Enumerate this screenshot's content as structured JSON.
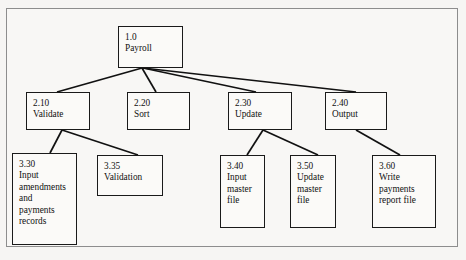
{
  "diagram": {
    "type": "hierarchy-tree",
    "background_color": "#f6f5f3",
    "frame_color": "#8d8d8d",
    "box_border_color": "#1a1a1a",
    "edge_color": "#111111",
    "levels": 3,
    "nodes": [
      {
        "id": "n1",
        "ref": "1.0",
        "lines": [
          "1.0",
          "Payroll"
        ],
        "level": 1,
        "x": 118,
        "y": 26,
        "w": 65,
        "h": 42
      },
      {
        "id": "n210",
        "ref": "2.10",
        "lines": [
          "2.10",
          "Validate"
        ],
        "level": 2,
        "x": 26,
        "y": 92,
        "w": 64,
        "h": 38
      },
      {
        "id": "n220",
        "ref": "2.20",
        "lines": [
          "2.20",
          "Sort"
        ],
        "level": 2,
        "x": 127,
        "y": 92,
        "w": 63,
        "h": 38
      },
      {
        "id": "n230",
        "ref": "2.30",
        "lines": [
          "2.30",
          "Update"
        ],
        "level": 2,
        "x": 228,
        "y": 92,
        "w": 64,
        "h": 38
      },
      {
        "id": "n240",
        "ref": "2.40",
        "lines": [
          "2.40",
          "Output"
        ],
        "level": 2,
        "x": 325,
        "y": 92,
        "w": 62,
        "h": 38
      },
      {
        "id": "n330",
        "ref": "3.30",
        "lines": [
          "3.30",
          "Input",
          "amendments",
          "and",
          "payments",
          "records"
        ],
        "level": 3,
        "x": 12,
        "y": 153,
        "w": 65,
        "h": 92
      },
      {
        "id": "n335",
        "ref": "3.35",
        "lines": [
          "3.35",
          "Validation"
        ],
        "level": 3,
        "x": 97,
        "y": 155,
        "w": 66,
        "h": 41
      },
      {
        "id": "n340",
        "ref": "3.40",
        "lines": [
          "3.40",
          "Input",
          "master",
          "file"
        ],
        "level": 3,
        "x": 220,
        "y": 155,
        "w": 45,
        "h": 73
      },
      {
        "id": "n350",
        "ref": "3.50",
        "lines": [
          "3.50",
          "Update",
          "master",
          "file"
        ],
        "level": 3,
        "x": 290,
        "y": 155,
        "w": 46,
        "h": 73
      },
      {
        "id": "n360",
        "ref": "3.60",
        "lines": [
          "3.60",
          "Write",
          "payments",
          "report file"
        ],
        "level": 3,
        "x": 372,
        "y": 155,
        "w": 64,
        "h": 73
      }
    ],
    "edges": [
      {
        "from": "n1",
        "to": "n210",
        "x1": 142,
        "y1": 68,
        "x2": 57,
        "y2": 92
      },
      {
        "from": "n1",
        "to": "n220",
        "x1": 142,
        "y1": 68,
        "x2": 156,
        "y2": 92
      },
      {
        "from": "n1",
        "to": "n230",
        "x1": 143,
        "y1": 68,
        "x2": 256,
        "y2": 92
      },
      {
        "from": "n1",
        "to": "n240",
        "x1": 143,
        "y1": 68,
        "x2": 356,
        "y2": 92
      },
      {
        "from": "n210",
        "to": "n330",
        "x1": 62,
        "y1": 130,
        "x2": 50,
        "y2": 153
      },
      {
        "from": "n210",
        "to": "n335",
        "x1": 62,
        "y1": 130,
        "x2": 138,
        "y2": 155
      },
      {
        "from": "n230",
        "to": "n340",
        "x1": 263,
        "y1": 130,
        "x2": 247,
        "y2": 155
      },
      {
        "from": "n230",
        "to": "n350",
        "x1": 263,
        "y1": 130,
        "x2": 318,
        "y2": 155
      },
      {
        "from": "n240",
        "to": "n360",
        "x1": 356,
        "y1": 130,
        "x2": 400,
        "y2": 155
      }
    ]
  }
}
